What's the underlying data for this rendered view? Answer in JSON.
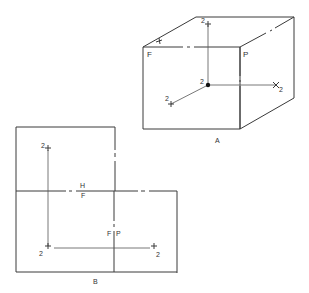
{
  "diagram": {
    "figure_a": {
      "caption": "A",
      "planes": {
        "frontal": "F",
        "profile": "P"
      },
      "axis_labels": {
        "up": "2",
        "right": "2",
        "front": "2",
        "origin": "2"
      },
      "description": "Isometric glass box with point 2 projected onto frontal, horizontal and profile planes"
    },
    "figure_b": {
      "caption": "B",
      "fold_lines": {
        "horizontal_top": "H",
        "horizontal_bottom": "F",
        "vertical_left": "F",
        "vertical_right": "P"
      },
      "point_labels": {
        "top": "2",
        "front": "2",
        "side": "2"
      },
      "description": "Unfolded planes showing orthographic projections of point 2"
    }
  }
}
